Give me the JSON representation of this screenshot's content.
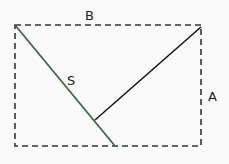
{
  "diagram": {
    "labels": {
      "top": "B",
      "side": "A",
      "diagonal": "S"
    },
    "colors": {
      "background": "#fafafa",
      "rectangle": "#333344",
      "diagonal": "#3a6b3a",
      "perpendicular": "#111111"
    },
    "rectangle": {
      "x1": 15,
      "y1": 25,
      "x2": 201,
      "y2": 146,
      "style": "dashed"
    },
    "diagonal_line": {
      "x1": 15,
      "y1": 25,
      "x2": 115,
      "y2": 146
    },
    "perpendicular_line": {
      "x1": 95,
      "y1": 120,
      "x2": 201,
      "y2": 27
    }
  }
}
